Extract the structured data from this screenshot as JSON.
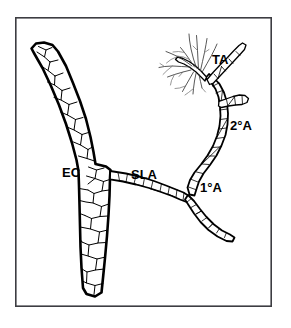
{
  "figure": {
    "background_color": "#ffffff",
    "ink_color": "#000000",
    "frame_color": "#3d3d42",
    "frame": {
      "x": 15,
      "y": 17,
      "width": 257,
      "height": 290
    },
    "labels": [
      {
        "id": "ec",
        "text": "EC",
        "x": 62,
        "y": 177,
        "font_size": 13
      },
      {
        "id": "sla",
        "text": "SLA",
        "x": 131,
        "y": 179,
        "font_size": 13
      },
      {
        "id": "ta",
        "text": "TA",
        "x": 212,
        "y": 64,
        "font_size": 13
      },
      {
        "id": "sec",
        "text": "2°A",
        "x": 230,
        "y": 130,
        "font_size": 13
      },
      {
        "id": "pri",
        "text": "1°A",
        "x": 200,
        "y": 192,
        "font_size": 13
      }
    ],
    "structures": [
      {
        "id": "ec-vessel",
        "name": "collecting-venule-endothelial-cells",
        "label_ref": "EC"
      },
      {
        "id": "sla-vessel",
        "name": "small-lateral-arteriole",
        "label_ref": "SLA"
      },
      {
        "id": "primary-arteriole",
        "name": "first-order-arteriole",
        "label_ref": "1°A"
      },
      {
        "id": "secondary-arteriole",
        "name": "second-order-arteriole",
        "label_ref": "2°A"
      },
      {
        "id": "terminal-arteriole",
        "name": "terminal-arteriole-capillary-tuft",
        "label_ref": "TA"
      }
    ]
  }
}
